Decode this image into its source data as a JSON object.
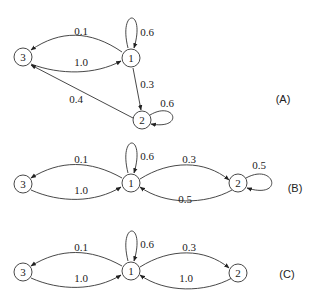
{
  "diagrams": [
    {
      "label": "(A)",
      "nodes": {
        "n1": "1",
        "n2": "2",
        "n3": "3"
      },
      "edges": {
        "e11": "0.6",
        "e13": "0.1",
        "e31": "1.0",
        "e12": "0.3",
        "e22": "0.6",
        "e23": "0.4"
      }
    },
    {
      "label": "(B)",
      "nodes": {
        "n1": "1",
        "n2": "2",
        "n3": "3"
      },
      "edges": {
        "e11": "0.6",
        "e13": "0.1",
        "e31": "1.0",
        "e12": "0.3",
        "e21": "0.5",
        "e22": "0.5"
      }
    },
    {
      "label": "(C)",
      "nodes": {
        "n1": "1",
        "n2": "2",
        "n3": "3"
      },
      "edges": {
        "e11": "0.6",
        "e13": "0.1",
        "e31": "1.0",
        "e12": "0.3",
        "e21": "1.0"
      }
    }
  ]
}
